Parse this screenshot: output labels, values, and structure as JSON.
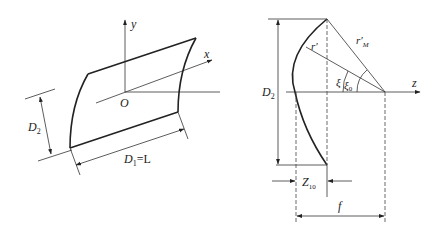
{
  "left_figure": {
    "axis_y": "y",
    "axis_x": "x",
    "axis_z": "z",
    "origin": "O",
    "dim_height": "D",
    "dim_height_sub": "2",
    "dim_length": "D",
    "dim_length_sub": "1",
    "dim_length_eq": "=L"
  },
  "right_figure": {
    "axis_z": "z",
    "dim_height": "D",
    "dim_height_sub": "2",
    "radius": "r′",
    "radius_max": "r′",
    "radius_max_sub": "M",
    "angle": "ξ",
    "angle0": "ξ",
    "angle0_sub": "0",
    "dim_z10": "Z",
    "dim_z10_sub": "10",
    "dim_focal": "f"
  },
  "colors": {
    "stroke": "#222222",
    "background": "#ffffff"
  }
}
